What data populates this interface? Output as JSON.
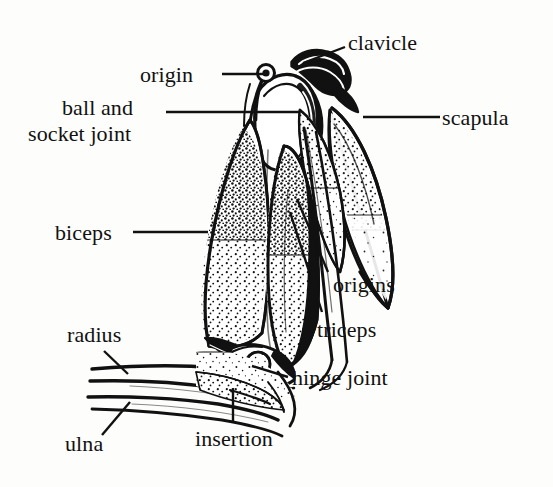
{
  "figure": {
    "type": "anatomical-line-diagram",
    "background_color": "#fdfdfb",
    "ink_color": "#111111",
    "labels": [
      {
        "id": "clavicle",
        "text": "clavicle",
        "x": 348,
        "y": 30,
        "align": "left"
      },
      {
        "id": "origin",
        "text": "origin",
        "x": 140,
        "y": 62,
        "align": "left"
      },
      {
        "id": "scapula",
        "text": "scapula",
        "x": 442,
        "y": 105,
        "align": "left"
      },
      {
        "id": "ball-and",
        "text": "ball and",
        "x": 62,
        "y": 95,
        "align": "left"
      },
      {
        "id": "socket-joint",
        "text": "socket joint",
        "x": 28,
        "y": 121,
        "align": "left"
      },
      {
        "id": "biceps",
        "text": "biceps",
        "x": 55,
        "y": 220,
        "align": "left"
      },
      {
        "id": "origins",
        "text": "origins",
        "x": 333,
        "y": 272,
        "align": "left"
      },
      {
        "id": "triceps",
        "text": "triceps",
        "x": 317,
        "y": 317,
        "align": "left"
      },
      {
        "id": "radius",
        "text": "radius",
        "x": 67,
        "y": 322,
        "align": "left"
      },
      {
        "id": "hinge-joint",
        "text": "hinge joint",
        "x": 292,
        "y": 365,
        "align": "left"
      },
      {
        "id": "insertion",
        "text": "insertion",
        "x": 195,
        "y": 426,
        "align": "left"
      },
      {
        "id": "ulna",
        "text": "ulna",
        "x": 65,
        "y": 431,
        "align": "left"
      }
    ],
    "leader_lines": [
      {
        "id": "clavicle-leader",
        "points": "345,47 303,63"
      },
      {
        "id": "origin-leader",
        "points": "222,74 268,74"
      },
      {
        "id": "scapula-leader",
        "points": "440,117 363,117"
      },
      {
        "id": "ball-socket-leader",
        "points": "166,112 300,112"
      },
      {
        "id": "biceps-leader",
        "points": "133,232 208,232"
      },
      {
        "id": "origins-leader",
        "points": "328,272 297,199"
      },
      {
        "id": "triceps-leader",
        "points": "322,312 290,212"
      },
      {
        "id": "radius-leader",
        "points": "104,351 128,374"
      },
      {
        "id": "hinge-joint-leader",
        "points": "288,377 252,366"
      },
      {
        "id": "insertion-leader",
        "points": "233,423 233,388"
      },
      {
        "id": "ulna-leader",
        "points": "102,435 130,402"
      }
    ],
    "anatomy_parts": [
      "clavicle",
      "scapula",
      "humeral head",
      "ball and socket joint",
      "biceps brachii",
      "triceps brachii",
      "tendon origins",
      "tendon insertion",
      "hinge joint (elbow)",
      "radius",
      "ulna"
    ]
  }
}
